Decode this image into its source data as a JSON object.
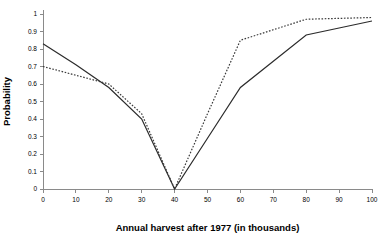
{
  "chart_data": {
    "type": "line",
    "title": "",
    "xlabel": "Annual harvest after 1977 (in thousands)",
    "ylabel": "Probability",
    "xlim": [
      0,
      100
    ],
    "ylim": [
      0,
      1
    ],
    "grid": false,
    "legend": "none",
    "x_ticks": [
      "0",
      "10",
      "20",
      "30",
      "40",
      "50",
      "60",
      "70",
      "80",
      "90",
      "100"
    ],
    "x_tick_values": [
      0,
      10,
      20,
      30,
      40,
      50,
      60,
      70,
      80,
      90,
      100
    ],
    "y_ticks": [
      "0",
      "0.1",
      "0.2",
      "0.3",
      "0.4",
      "0.5",
      "0.6",
      "0.7",
      "0.8",
      "0.9",
      "1"
    ],
    "y_tick_values": [
      0,
      0.1,
      0.2,
      0.3,
      0.4,
      0.5,
      0.6,
      0.7,
      0.8,
      0.9,
      1
    ],
    "x": [
      0,
      10,
      20,
      30,
      40,
      50,
      60,
      70,
      80,
      90,
      100
    ],
    "series": [
      {
        "name": "solid-line",
        "style": "solid",
        "color": "#2b2b2b",
        "values": [
          0.83,
          0.71,
          0.58,
          0.4,
          0.0,
          0.29,
          0.58,
          0.73,
          0.88,
          0.92,
          0.96
        ]
      },
      {
        "name": "dotted-line",
        "style": "dotted",
        "color": "#3a3a3a",
        "values": [
          0.7,
          0.65,
          0.6,
          0.43,
          0.0,
          0.43,
          0.85,
          0.91,
          0.97,
          0.975,
          0.98
        ]
      }
    ]
  },
  "axis_titles": {
    "x": "Annual harvest after 1977 (in thousands)",
    "y": "Probability"
  }
}
